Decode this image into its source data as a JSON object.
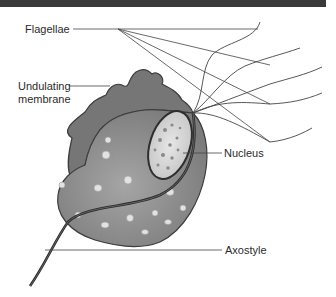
{
  "diagram": {
    "labels": {
      "flagellae": "Flagellae",
      "undulating_membrane_line1": "Undulating",
      "undulating_membrane_line2": "membrane",
      "nucleus": "Nucleus",
      "axostyle": "Axostyle"
    },
    "colors": {
      "top_bar": "#3a3a3a",
      "body_fill": "#8f8f8f",
      "membrane_fill": "#7a7a7a",
      "nucleus_fill": "#d8d8d8",
      "outline": "#3c3c3c",
      "leader_line": "#444444",
      "text": "#2b2b2b"
    }
  }
}
